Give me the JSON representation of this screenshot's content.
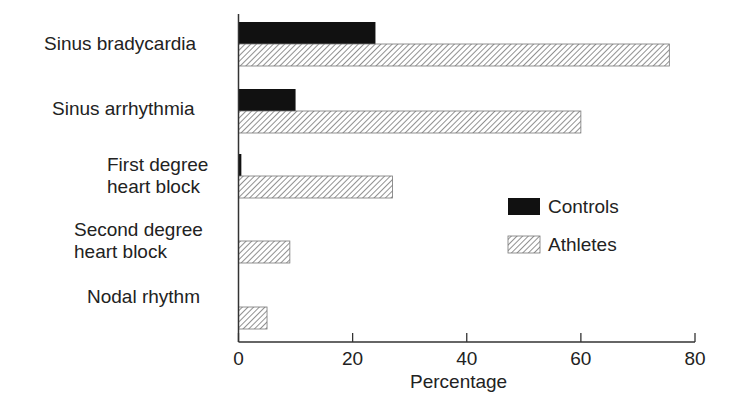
{
  "chart_data": {
    "type": "bar",
    "orientation": "horizontal",
    "title": "",
    "xlabel": "Percentage",
    "ylabel": "",
    "xlim": [
      0,
      80
    ],
    "xticks": [
      0,
      20,
      40,
      60,
      80
    ],
    "grid": false,
    "legend_position": "right-center",
    "categories": [
      "Sinus bradycardia",
      "Sinus arrhythmia",
      "First degree heart block",
      "Second degree heart block",
      "Nodal rhythm"
    ],
    "series": [
      {
        "name": "Controls",
        "style": "solid-black",
        "values": [
          24,
          10,
          0.5,
          0,
          0
        ]
      },
      {
        "name": "Athletes",
        "style": "diagonal-hatch",
        "values": [
          75.5,
          60,
          27,
          9,
          5
        ]
      }
    ]
  },
  "labels": {
    "cat0": "Sinus bradycardia",
    "cat1": "Sinus arrhythmia",
    "cat2a": "First degree",
    "cat2b": "heart block",
    "cat3a": "Second degree",
    "cat3b": "heart block",
    "cat4": "Nodal rhythm",
    "xlabel": "Percentage",
    "ticks": [
      "0",
      "20",
      "40",
      "60",
      "80"
    ],
    "legend_controls": "Controls",
    "legend_athletes": "Athletes"
  },
  "colors": {
    "controls": "#111111",
    "hatch": "#555555",
    "axis": "#333333"
  }
}
